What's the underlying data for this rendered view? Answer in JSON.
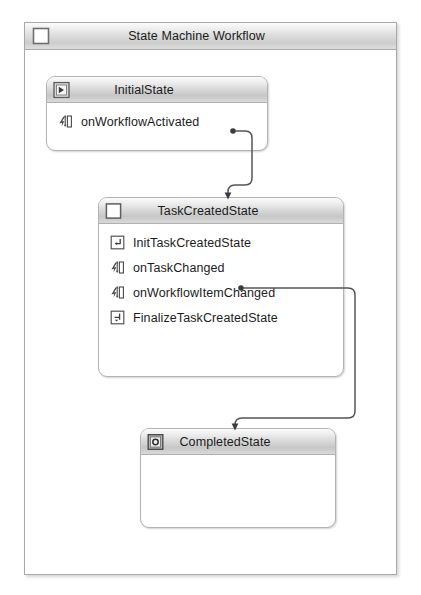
{
  "root": {
    "title": "State Machine Workflow",
    "icon": "workflow-square-icon"
  },
  "states": [
    {
      "id": "initial-state",
      "title": "InitialState",
      "icon": "initial-state-icon",
      "activities": [
        {
          "label": "onWorkflowActivated",
          "icon": "event-handler-icon"
        }
      ]
    },
    {
      "id": "task-created-state",
      "title": "TaskCreatedState",
      "icon": "state-square-icon",
      "activities": [
        {
          "label": "InitTaskCreatedState",
          "icon": "state-initialization-icon"
        },
        {
          "label": "onTaskChanged",
          "icon": "event-handler-icon"
        },
        {
          "label": "onWorkflowItemChanged",
          "icon": "event-handler-icon"
        },
        {
          "label": "FinalizeTaskCreatedState",
          "icon": "state-finalization-icon"
        }
      ]
    },
    {
      "id": "completed-state",
      "title": "CompletedState",
      "icon": "completed-state-icon",
      "activities": []
    }
  ],
  "transitions": [
    {
      "id": "transition-initial-to-taskcreated",
      "from": "onWorkflowActivated",
      "to": "TaskCreatedState"
    },
    {
      "id": "transition-taskcreated-to-completed",
      "from": "onTaskChanged",
      "to": "CompletedState"
    }
  ],
  "colors": {
    "header_gradient_top": "#fbfbfb",
    "header_gradient_bottom": "#c7c7c7",
    "border": "#b3b3b3",
    "connector": "#555555",
    "text": "#1c1c1c",
    "canvas": "#ffffff"
  }
}
